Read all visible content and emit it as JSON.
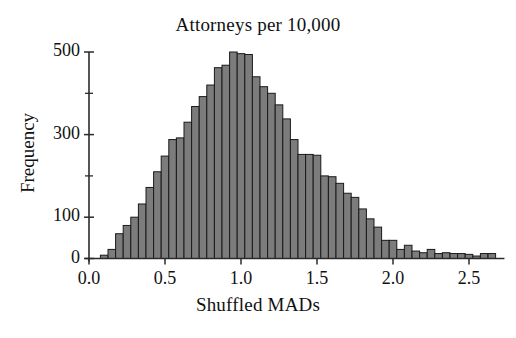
{
  "chart_data": {
    "type": "bar",
    "title": "Attorneys per 10,000",
    "xlabel": "Shuffled MADs",
    "ylabel": "Frequency",
    "grid": false,
    "legend": null,
    "xlim": [
      0.0,
      2.72
    ],
    "ylim": [
      0,
      520
    ],
    "bin_width": 0.05,
    "x_ticks": [
      0.0,
      0.5,
      1.0,
      1.5,
      2.0,
      2.5
    ],
    "x_tick_labels": [
      "0.0",
      "0.5",
      "1.0",
      "1.5",
      "2.0",
      "2.5"
    ],
    "y_ticks": [
      0,
      100,
      300,
      500
    ],
    "y_tick_labels": [
      "0",
      "100",
      "300",
      "500"
    ],
    "y_minor_ticks": [
      200,
      400
    ],
    "bar_fill": "#7c7c7c",
    "bar_edge": "#1a1a1a",
    "axis_color": "#2b2b2b",
    "categories": [
      0.1,
      0.15,
      0.2,
      0.25,
      0.3,
      0.35,
      0.4,
      0.45,
      0.5,
      0.55,
      0.6,
      0.65,
      0.7,
      0.75,
      0.8,
      0.85,
      0.9,
      0.95,
      1.0,
      1.05,
      1.1,
      1.15,
      1.2,
      1.25,
      1.3,
      1.35,
      1.4,
      1.45,
      1.5,
      1.55,
      1.6,
      1.65,
      1.7,
      1.75,
      1.8,
      1.85,
      1.9,
      1.95,
      2.0,
      2.05,
      2.1,
      2.15,
      2.2,
      2.25,
      2.3,
      2.35,
      2.4,
      2.45,
      2.5,
      2.55,
      2.6,
      2.65
    ],
    "values": [
      8,
      22,
      60,
      80,
      100,
      132,
      172,
      210,
      248,
      288,
      292,
      330,
      368,
      392,
      420,
      462,
      468,
      500,
      496,
      494,
      440,
      416,
      400,
      372,
      338,
      288,
      252,
      252,
      250,
      200,
      198,
      182,
      158,
      148,
      120,
      96,
      76,
      44,
      44,
      22,
      32,
      18,
      14,
      22,
      12,
      14,
      12,
      12,
      10,
      6,
      12,
      12
    ]
  }
}
